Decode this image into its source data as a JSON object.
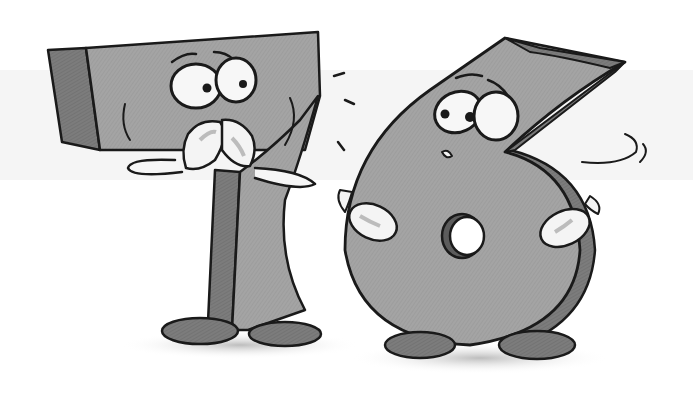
{
  "illustration": {
    "subject": "Cartoon numbers seven and six",
    "characters": [
      {
        "name": "seven",
        "glyph": "7",
        "expression": "worried",
        "pose": "hands clasped at mouth"
      },
      {
        "name": "six",
        "glyph": "6",
        "expression": "nervous",
        "pose": "hands on hips"
      }
    ],
    "palette": {
      "background": "#ffffff",
      "band": "#f1f1f1",
      "body_light": "#a9a9a9",
      "body_mid": "#8f8f8f",
      "body_dark": "#6e6e6e",
      "shoe": "#7a7a7a",
      "glove": "#f4f4f4",
      "ink": "#1a1a1a",
      "shadow": "#cfcfcf"
    }
  }
}
